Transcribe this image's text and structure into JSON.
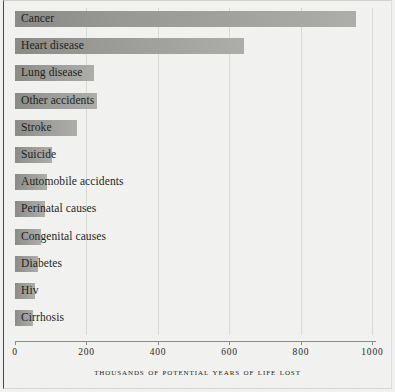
{
  "chart_data": {
    "type": "bar",
    "orientation": "horizontal",
    "title": "",
    "xlabel": "Thousands Of Potential Years Of Life Lost",
    "ylabel": "",
    "xlim": [
      0,
      1010
    ],
    "grid": true,
    "legend": "none",
    "xticks": [
      0,
      200,
      400,
      600,
      800,
      1000
    ],
    "xticklabels": [
      "0",
      "200",
      "400",
      "600",
      "800",
      "1000"
    ],
    "categories": [
      "Cancer",
      "Heart disease",
      "Lung disease",
      "Other accidents",
      "Stroke",
      "Suicide",
      "Automobile accidents",
      "Perinatal causes",
      "Congenital causes",
      "Diabetes",
      "Hiv",
      "Cirrhosis"
    ],
    "values": [
      955,
      641,
      222,
      230,
      174,
      104,
      90,
      84,
      72,
      65,
      56,
      51
    ]
  },
  "style": {
    "bar_color": "#97978f",
    "background_color": "#eceae6",
    "text_color": "#211f1c",
    "axis_color": "#8c8c88",
    "frame_color": "#4a4a46"
  }
}
